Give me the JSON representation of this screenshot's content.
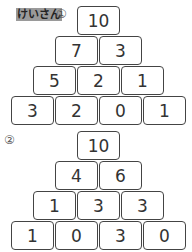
{
  "header": {
    "label": "けいさん"
  },
  "problems": [
    {
      "number": "①",
      "rows": [
        [
          "10"
        ],
        [
          "7",
          "3"
        ],
        [
          "5",
          "2",
          "1"
        ],
        [
          "3",
          "2",
          "0",
          "1"
        ]
      ]
    },
    {
      "number": "②",
      "rows": [
        [
          "10"
        ],
        [
          "4",
          "6"
        ],
        [
          "1",
          "3",
          "3"
        ],
        [
          "1",
          "0",
          "3",
          "0"
        ]
      ]
    }
  ]
}
